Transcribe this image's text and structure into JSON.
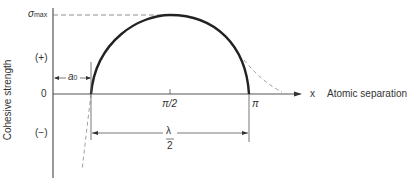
{
  "diagram": {
    "y_axis_label": "Cohesive strength",
    "x_axis_label": "Atomic separation",
    "x_axis_symbol": "x",
    "sigma_max": {
      "symbol": "σ",
      "subscript": "max"
    },
    "y_ticks": {
      "positive": "(+)",
      "zero": "0",
      "negative": "(−)"
    },
    "x_ticks": {
      "half_pi": "π/2",
      "pi": "π"
    },
    "a0_label": {
      "symbol": "a",
      "subscript": "0"
    },
    "lambda_label": {
      "numerator": "λ",
      "denominator": "2"
    }
  }
}
